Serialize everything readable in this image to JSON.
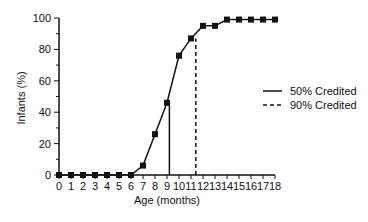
{
  "chart_data": {
    "type": "line",
    "title": "",
    "xlabel": "Age  (months)",
    "ylabel": "Infants  (%)",
    "xlim": [
      0,
      18
    ],
    "ylim": [
      0,
      100
    ],
    "x_ticks": [
      0,
      1,
      2,
      3,
      4,
      5,
      6,
      7,
      8,
      9,
      10,
      11,
      12,
      13,
      14,
      15,
      16,
      17,
      18
    ],
    "y_ticks": [
      0,
      20,
      40,
      60,
      80,
      100
    ],
    "y_minor_ticks": [
      10,
      30,
      50,
      70,
      90
    ],
    "grid": false,
    "series": [
      {
        "name": "Infants credited (%)",
        "marker": "square",
        "x": [
          0,
          1,
          2,
          3,
          4,
          5,
          6,
          7,
          8,
          9,
          10,
          11,
          12,
          13,
          14,
          15,
          16,
          17,
          18
        ],
        "values": [
          0,
          0,
          0,
          0,
          0,
          0,
          0,
          6,
          26,
          46,
          76,
          87,
          95,
          95,
          99,
          99,
          99,
          99,
          99
        ]
      }
    ],
    "reference_lines": [
      {
        "name": "50% Credited",
        "x": 9.2,
        "style": "solid",
        "y_to": 46
      },
      {
        "name": "90% Credited",
        "x": 11.4,
        "style": "dashed",
        "y_to": 87
      }
    ],
    "legend": {
      "position": "right",
      "entries": [
        {
          "label": "50% Credited",
          "style": "solid"
        },
        {
          "label": "90% Credited",
          "style": "dashed"
        }
      ]
    }
  },
  "colors": {
    "line": "#111111",
    "background": "#ffffff"
  }
}
